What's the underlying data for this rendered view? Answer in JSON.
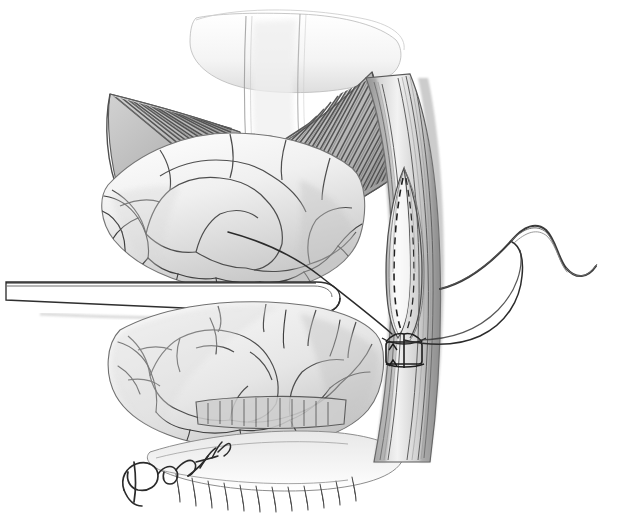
{
  "image": {
    "kind": "medical-surgical-illustration",
    "medium": "graphite pencil drawing",
    "background_color": "#ffffff",
    "ink_color": "#3a3a3a",
    "width": 627,
    "height": 530
  },
  "signature": {
    "text": "Dohasti",
    "position": "bottom-left-center"
  },
  "structures": [
    {
      "name": "fan-shaped-muscle-left",
      "label": "radiating muscle fibers (left belly)"
    },
    {
      "name": "fan-shaped-muscle-right",
      "label": "radiating muscle fibers (right belly)"
    },
    {
      "name": "central-tendon",
      "label": "central tendon / linea alba"
    },
    {
      "name": "fat-lobules-upper",
      "label": "lobulated adipose tissue, upper"
    },
    {
      "name": "fat-lobules-lower",
      "label": "lobulated adipose tissue, lower"
    },
    {
      "name": "vessel-column",
      "label": "longitudinal vascular sheath"
    },
    {
      "name": "longitudinal-incision",
      "label": "longitudinal incision with dashed suture line"
    },
    {
      "name": "suture-stitch",
      "label": "placed stitch with entry arrows"
    },
    {
      "name": "retractor-blade",
      "label": "flat retractor blade"
    },
    {
      "name": "suture-thread",
      "label": "running suture thread"
    },
    {
      "name": "curved-needle",
      "label": "curved surgical needle"
    }
  ],
  "palette": {
    "paper": "#ffffff",
    "line_dark": "#3a3a3a",
    "line_mid": "#6e6e6e",
    "line_light": "#a8a8a8",
    "wash_light": "#ececec",
    "wash_mid": "#d8d8d8",
    "wash_dark": "#b4b4b4"
  },
  "caption": ""
}
